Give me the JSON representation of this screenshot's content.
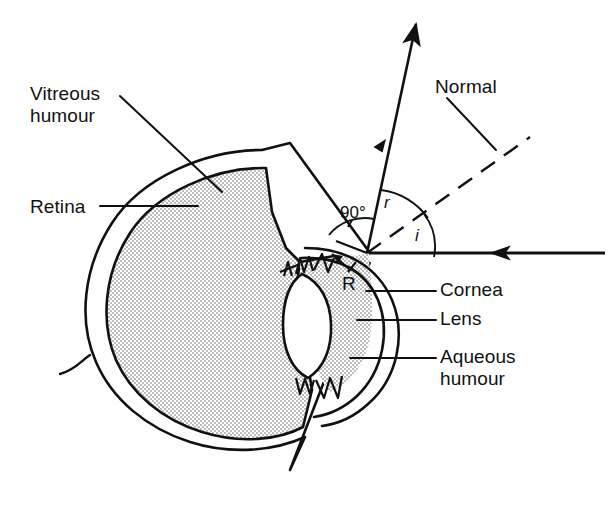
{
  "figure": {
    "background_color": "#ffffff",
    "ink_color": "#111111",
    "fill_color": "#dcdcdc",
    "width": 611,
    "height": 506
  },
  "labels": {
    "vitreous_humour": "Vitreous\nhumour",
    "retina": "Retina",
    "normal": "Normal",
    "cornea": "Cornea",
    "lens": "Lens",
    "aqueous_humour": "Aqueous\nhumour",
    "angle_90": "90°",
    "angle_r": "r",
    "angle_i": "i",
    "point_R": "R"
  },
  "icons": {
    "incident_ray": "arrow-left-icon",
    "refracted_ray": "arrow-up-icon",
    "sclera_top": "arrow-head-icon",
    "sclera_bottom": "arrow-head-icon",
    "normal_line": "dashed-line-icon"
  },
  "annotations": {
    "incident_angle_symbol": "i",
    "refraction_angle_symbol": "r",
    "right_angle_value": "90°",
    "refraction_point_symbol": "R"
  },
  "parts": [
    "sclera",
    "retina",
    "vitreous humour",
    "lens",
    "ciliary muscle",
    "aqueous humour",
    "cornea"
  ]
}
